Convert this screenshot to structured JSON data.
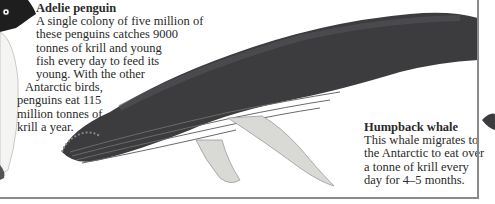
{
  "penguin": {
    "title": "Adelie penguin",
    "lines": [
      "A single colony of five million of",
      "these penguins catches 9000",
      "tonnes of krill and young",
      "fish every day to feed its",
      "young. With the other",
      "Antarctic birds,",
      "penguins eat 115",
      "million tonnes of",
      "krill a year."
    ]
  },
  "whale": {
    "title": "Humpback whale",
    "lines": [
      "This whale migrates to",
      "the Antarctic to eat over",
      "a tonne of krill every",
      "day for 4–5 months."
    ]
  },
  "colors": {
    "whale_body": "#3c3b3d",
    "whale_fin": "#d9d9d6",
    "penguin_black": "#1e1e1e",
    "frame": "#8a8a8a",
    "text": "#2a2a2a"
  }
}
